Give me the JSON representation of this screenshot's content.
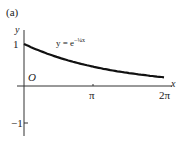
{
  "panel_label": "(a)",
  "equation_base": "y = e",
  "equation_exp": "−¼x",
  "origin_label": "O",
  "axis": {
    "x_label": "x",
    "y_label": "y"
  },
  "ticks": {
    "y_pos": "1",
    "y_neg": "−1",
    "x_pi": "π",
    "x_2pi": "2π"
  },
  "chart_data": {
    "type": "line",
    "title": "(a)",
    "annotation": "y = e^(−x/4)",
    "xlabel": "x",
    "ylabel": "y",
    "x_ticks": [
      "π",
      "2π"
    ],
    "y_ticks": [
      "1",
      "−1"
    ],
    "xlim": [
      0,
      6.283
    ],
    "ylim": [
      -1,
      1
    ],
    "grid": false,
    "series": [
      {
        "name": "y = e^(−x/4)",
        "x": [
          0,
          0.785,
          1.571,
          2.356,
          3.142,
          3.927,
          4.712,
          5.498,
          6.283
        ],
        "values": [
          1.0,
          0.82,
          0.675,
          0.555,
          0.456,
          0.375,
          0.308,
          0.253,
          0.208
        ]
      }
    ]
  }
}
